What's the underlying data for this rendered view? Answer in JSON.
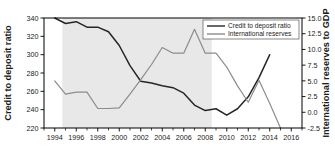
{
  "chart_data": {
    "type": "line",
    "title": "",
    "xlabel": "",
    "ylabel": "Credit to deposit ratio",
    "y2label": "International reserves to GDP",
    "xlim": [
      1993,
      2017
    ],
    "ylim": [
      220,
      340
    ],
    "y2lim": [
      -2.5,
      15.0
    ],
    "grid": false,
    "legend_position": "top-right",
    "x_ticks": [
      1994,
      1996,
      1998,
      2000,
      2002,
      2004,
      2006,
      2008,
      2010,
      2012,
      2014,
      2016
    ],
    "x_tick_labels": [
      "1994",
      "1996",
      "1998",
      "2000",
      "2002",
      "2004",
      "2006",
      "2008",
      "2010",
      "2012",
      "2014",
      "2016"
    ],
    "x_minor_ticks": [
      1993,
      1995,
      1997,
      1999,
      2001,
      2003,
      2005,
      2007,
      2009,
      2011,
      2013,
      2015,
      2017
    ],
    "y_ticks": [
      220,
      240,
      260,
      280,
      300,
      320,
      340
    ],
    "y_tick_labels": [
      "220",
      "240",
      "260",
      "280",
      "300",
      "320",
      "340"
    ],
    "y2_ticks": [
      -2.5,
      0.0,
      2.5,
      5.0,
      7.5,
      10.0,
      12.5,
      15.0
    ],
    "y2_tick_labels": [
      "-2.5",
      "0.0",
      "2.5",
      "5.0",
      "7.5",
      "10.0",
      "12.5",
      "15.0"
    ],
    "shaded_region": {
      "x_start": 1994.7,
      "x_end": 2008.6,
      "color": "#e8e8e8",
      "label": ""
    },
    "series": [
      {
        "name": "Credit to deposit ratio",
        "axis": "left",
        "color": "#262626",
        "width": 1.5,
        "x": [
          1994,
          1995,
          1996,
          1997,
          1998,
          1999,
          2000,
          2001,
          2002,
          2003,
          2004,
          2005,
          2006,
          2007,
          2008,
          2009,
          2010,
          2011,
          2012,
          2013,
          2014
        ],
        "values": [
          340,
          334,
          336,
          330,
          330,
          325,
          310,
          288,
          271,
          269,
          266,
          264,
          258,
          245,
          239,
          241,
          234,
          241,
          254,
          275,
          300
        ]
      },
      {
        "name": "International reserves",
        "axis": "right",
        "color": "#8c8c8c",
        "width": 1.2,
        "x": [
          1994,
          1995,
          1996,
          1997,
          1998,
          1999,
          2000,
          2001,
          2002,
          2003,
          2004,
          2005,
          2006,
          2007,
          2008,
          2009,
          2010,
          2011,
          2012,
          2013,
          2014,
          2015
        ],
        "values": [
          5.0,
          2.9,
          3.2,
          3.2,
          0.6,
          0.6,
          0.7,
          2.9,
          5.2,
          7.6,
          10.3,
          9.4,
          9.4,
          13.2,
          9.4,
          9.4,
          7.2,
          4.2,
          1.6,
          5.1,
          1.4,
          -2.5
        ]
      }
    ]
  },
  "legend": {
    "entries": [
      {
        "label": "Credit to deposit ratio",
        "color": "#262626"
      },
      {
        "label": "International reserves",
        "color": "#8c8c8c"
      }
    ]
  }
}
